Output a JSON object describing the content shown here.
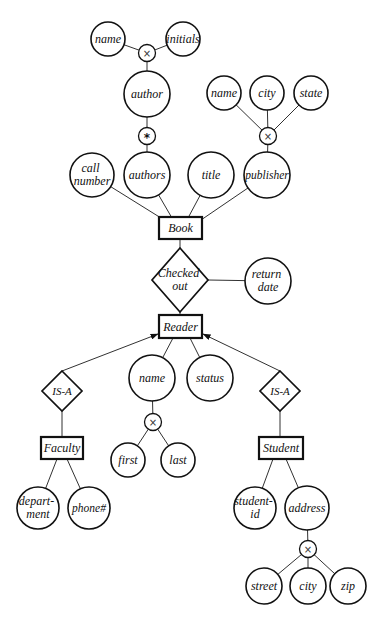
{
  "diagram": {
    "entities": {
      "book": "Book",
      "reader": "Reader",
      "faculty": "Faculty",
      "student": "Student"
    },
    "relationships": {
      "checked_out": [
        "Checked",
        "out"
      ],
      "isa_faculty": "IS-A",
      "isa_student": "IS-A"
    },
    "attributes": {
      "author_name": "name",
      "author_initials": "initials",
      "author": "author",
      "authors": "authors",
      "call_number": [
        "call",
        "number"
      ],
      "title": "title",
      "publisher": "publisher",
      "publisher_name": "name",
      "publisher_city": "city",
      "publisher_state": "state",
      "return_date": [
        "return",
        "date"
      ],
      "reader_name": "name",
      "status": "status",
      "first": "first",
      "last": "last",
      "department": [
        "depart-",
        "ment"
      ],
      "phone": "phone#",
      "student_id": [
        "student-",
        "id"
      ],
      "address": "address",
      "street": "street",
      "address_city": "city",
      "zip": "zip"
    },
    "operators": {
      "product_symbol": "×",
      "set_symbol": "*"
    },
    "edges": [
      [
        "author_name",
        "product"
      ],
      [
        "author_initials",
        "product"
      ],
      [
        "product",
        "author"
      ],
      [
        "author",
        "set"
      ],
      [
        "set",
        "authors"
      ],
      [
        "call_number",
        "Book"
      ],
      [
        "authors",
        "Book"
      ],
      [
        "title",
        "Book"
      ],
      [
        "publisher",
        "Book"
      ],
      [
        "publisher_name",
        "product"
      ],
      [
        "publisher_city",
        "product"
      ],
      [
        "publisher_state",
        "product"
      ],
      [
        "product",
        "publisher"
      ],
      [
        "Book",
        "Checked out"
      ],
      [
        "Checked out",
        "return_date"
      ],
      [
        "Checked out",
        "Reader"
      ],
      [
        "Reader",
        "reader_name"
      ],
      [
        "Reader",
        "status"
      ],
      [
        "reader_name",
        "product"
      ],
      [
        "product",
        "first"
      ],
      [
        "product",
        "last"
      ],
      [
        "IS-A",
        "Reader",
        "arrow"
      ],
      [
        "IS-A",
        "Faculty"
      ],
      [
        "IS-A",
        "Reader",
        "arrow"
      ],
      [
        "IS-A",
        "Student"
      ],
      [
        "Faculty",
        "department"
      ],
      [
        "Faculty",
        "phone"
      ],
      [
        "Student",
        "student_id"
      ],
      [
        "Student",
        "address"
      ],
      [
        "address",
        "product"
      ],
      [
        "product",
        "street"
      ],
      [
        "product",
        "address_city"
      ],
      [
        "product",
        "zip"
      ]
    ]
  }
}
